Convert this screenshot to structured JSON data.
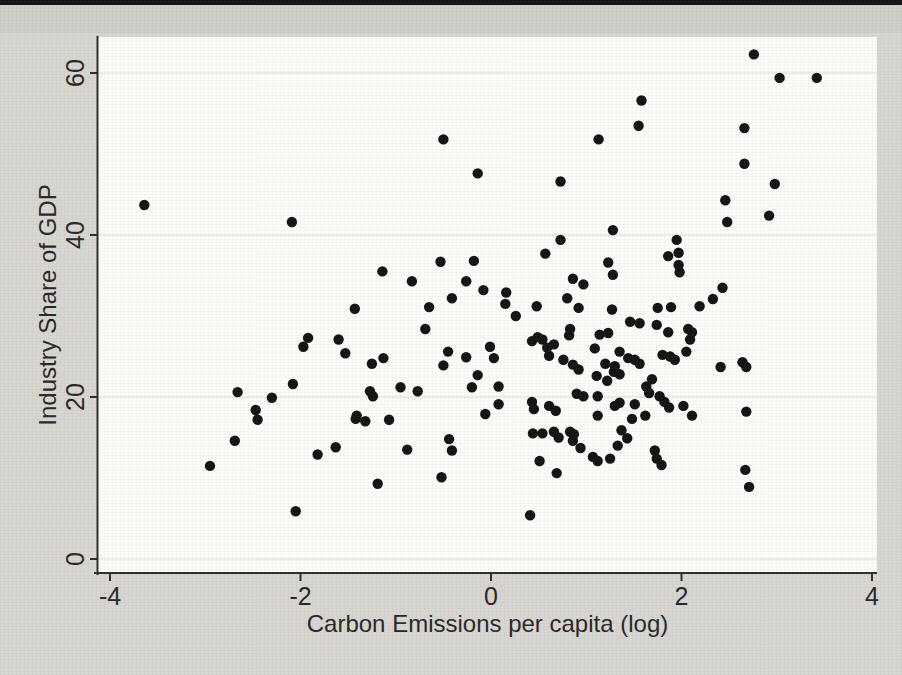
{
  "page": {
    "background": "#d8d6d1",
    "top_rule_color": "#141414",
    "scan_band_color": "#c9c8c3"
  },
  "chart_data": {
    "type": "scatter",
    "title": "",
    "xlabel": "Carbon Emissions per capita (log)",
    "ylabel": "Industry Share of GDP",
    "x_tick_labels": [
      "-4",
      "-2",
      "0",
      "2",
      "4"
    ],
    "x_tick_values": [
      -4,
      -2,
      0,
      2,
      4
    ],
    "y_tick_labels": [
      "0",
      "20",
      "40",
      "60"
    ],
    "y_tick_values": [
      0,
      20,
      40,
      60
    ],
    "xlim": [
      -4.15,
      4.05
    ],
    "ylim": [
      -1.7,
      64.5
    ],
    "grid": "horizontal-only",
    "legend": "none",
    "marker": {
      "shape": "circle",
      "color": "#131313",
      "radius_px": 5.2
    },
    "colors": {
      "plot_bg": "#fcfcf9",
      "grid": "#eae7e0",
      "axis": "#2e2e30",
      "label_text": "#28282a"
    },
    "points": [
      [
        -3.64,
        43.7
      ],
      [
        -2.09,
        41.6
      ],
      [
        -0.5,
        51.8
      ],
      [
        -0.14,
        47.6
      ],
      [
        1.13,
        51.8
      ],
      [
        0.73,
        46.6
      ],
      [
        0.73,
        39.4
      ],
      [
        0.57,
        37.7
      ],
      [
        1.28,
        40.6
      ],
      [
        -0.53,
        36.7
      ],
      [
        -0.18,
        36.8
      ],
      [
        -1.14,
        35.5
      ],
      [
        -0.83,
        34.3
      ],
      [
        -0.26,
        34.3
      ],
      [
        -0.08,
        33.2
      ],
      [
        -0.41,
        32.2
      ],
      [
        0.16,
        32.9
      ],
      [
        0.8,
        32.2
      ],
      [
        0.86,
        34.6
      ],
      [
        0.97,
        33.9
      ],
      [
        1.23,
        36.6
      ],
      [
        1.28,
        35.1
      ],
      [
        2.76,
        62.3
      ],
      [
        3.03,
        59.4
      ],
      [
        3.42,
        59.4
      ],
      [
        1.58,
        56.6
      ],
      [
        1.55,
        53.5
      ],
      [
        2.66,
        53.2
      ],
      [
        2.66,
        48.8
      ],
      [
        2.98,
        46.3
      ],
      [
        2.46,
        44.3
      ],
      [
        2.48,
        41.6
      ],
      [
        2.92,
        42.4
      ],
      [
        1.95,
        39.4
      ],
      [
        1.86,
        37.4
      ],
      [
        1.97,
        37.8
      ],
      [
        1.97,
        36.3
      ],
      [
        1.98,
        35.4
      ],
      [
        2.43,
        33.5
      ],
      [
        2.33,
        32.1
      ],
      [
        2.19,
        31.2
      ],
      [
        -1.43,
        30.9
      ],
      [
        -1.92,
        27.3
      ],
      [
        -1.97,
        26.2
      ],
      [
        -1.6,
        27.1
      ],
      [
        -1.53,
        25.4
      ],
      [
        -2.08,
        21.6
      ],
      [
        -2.66,
        20.6
      ],
      [
        -2.3,
        19.9
      ],
      [
        -2.47,
        18.4
      ],
      [
        -2.45,
        17.2
      ],
      [
        -2.69,
        14.6
      ],
      [
        -2.95,
        11.5
      ],
      [
        -1.82,
        12.9
      ],
      [
        -1.63,
        13.8
      ],
      [
        -2.05,
        5.9
      ],
      [
        -1.41,
        17.7
      ],
      [
        -0.65,
        31.1
      ],
      [
        0.15,
        31.5
      ],
      [
        0.26,
        30.0
      ],
      [
        0.48,
        31.2
      ],
      [
        0.92,
        31.0
      ],
      [
        1.27,
        30.8
      ],
      [
        0.83,
        28.4
      ],
      [
        0.82,
        27.6
      ],
      [
        -0.69,
        28.4
      ],
      [
        -0.45,
        25.6
      ],
      [
        -0.5,
        23.9
      ],
      [
        -1.13,
        24.8
      ],
      [
        -1.25,
        24.1
      ],
      [
        -0.95,
        21.2
      ],
      [
        -0.77,
        20.7
      ],
      [
        -1.27,
        20.7
      ],
      [
        -1.24,
        20.1
      ],
      [
        -1.42,
        17.3
      ],
      [
        -1.32,
        17.0
      ],
      [
        -1.07,
        17.2
      ],
      [
        -0.26,
        24.9
      ],
      [
        -0.01,
        26.2
      ],
      [
        0.03,
        24.8
      ],
      [
        -0.14,
        22.7
      ],
      [
        -0.2,
        21.2
      ],
      [
        0.08,
        21.3
      ],
      [
        0.08,
        19.1
      ],
      [
        -0.06,
        17.9
      ],
      [
        0.43,
        26.9
      ],
      [
        0.49,
        27.4
      ],
      [
        0.54,
        27.1
      ],
      [
        0.59,
        26.1
      ],
      [
        0.61,
        25.1
      ],
      [
        0.66,
        26.5
      ],
      [
        0.76,
        24.6
      ],
      [
        0.86,
        24.0
      ],
      [
        0.92,
        23.4
      ],
      [
        0.43,
        19.4
      ],
      [
        0.45,
        18.5
      ],
      [
        0.61,
        18.9
      ],
      [
        0.68,
        18.3
      ],
      [
        0.44,
        15.5
      ],
      [
        0.54,
        15.5
      ],
      [
        0.66,
        15.7
      ],
      [
        0.71,
        15.0
      ],
      [
        0.83,
        15.7
      ],
      [
        0.87,
        15.4
      ],
      [
        0.94,
        13.7
      ],
      [
        0.86,
        14.6
      ],
      [
        1.07,
        12.6
      ],
      [
        1.12,
        12.1
      ],
      [
        0.51,
        12.1
      ],
      [
        0.69,
        10.6
      ],
      [
        -0.52,
        10.1
      ],
      [
        -1.19,
        9.3
      ],
      [
        -0.44,
        14.8
      ],
      [
        -0.41,
        13.4
      ],
      [
        -0.88,
        13.5
      ],
      [
        0.41,
        5.4
      ],
      [
        1.14,
        27.7
      ],
      [
        1.23,
        27.9
      ],
      [
        1.09,
        26.0
      ],
      [
        1.2,
        24.1
      ],
      [
        1.11,
        22.6
      ],
      [
        1.22,
        22.0
      ],
      [
        1.29,
        23.1
      ],
      [
        0.9,
        20.4
      ],
      [
        0.97,
        20.1
      ],
      [
        1.12,
        20.1
      ],
      [
        1.12,
        17.7
      ],
      [
        1.75,
        31.0
      ],
      [
        1.89,
        31.1
      ],
      [
        1.46,
        29.3
      ],
      [
        1.56,
        29.1
      ],
      [
        1.74,
        28.9
      ],
      [
        1.86,
        28.0
      ],
      [
        2.07,
        28.4
      ],
      [
        2.11,
        28.0
      ],
      [
        2.09,
        27.1
      ],
      [
        1.8,
        25.2
      ],
      [
        1.88,
        25.0
      ],
      [
        1.93,
        24.6
      ],
      [
        2.05,
        25.6
      ],
      [
        1.35,
        25.6
      ],
      [
        1.44,
        24.8
      ],
      [
        1.51,
        24.6
      ],
      [
        1.56,
        24.1
      ],
      [
        1.3,
        23.8
      ],
      [
        1.35,
        22.8
      ],
      [
        2.41,
        23.7
      ],
      [
        2.64,
        24.3
      ],
      [
        2.68,
        23.7
      ],
      [
        2.68,
        18.2
      ],
      [
        1.69,
        22.2
      ],
      [
        1.63,
        21.3
      ],
      [
        1.66,
        20.5
      ],
      [
        1.77,
        20.1
      ],
      [
        1.82,
        19.4
      ],
      [
        1.87,
        18.7
      ],
      [
        2.02,
        18.9
      ],
      [
        2.11,
        17.7
      ],
      [
        1.35,
        19.3
      ],
      [
        1.3,
        18.9
      ],
      [
        1.51,
        19.1
      ],
      [
        1.48,
        17.3
      ],
      [
        1.62,
        17.7
      ],
      [
        1.37,
        15.9
      ],
      [
        1.33,
        14.0
      ],
      [
        1.25,
        12.4
      ],
      [
        1.72,
        13.4
      ],
      [
        1.74,
        12.4
      ],
      [
        1.79,
        11.6
      ],
      [
        1.43,
        14.9
      ],
      [
        2.67,
        11.0
      ],
      [
        2.71,
        8.9
      ]
    ]
  }
}
